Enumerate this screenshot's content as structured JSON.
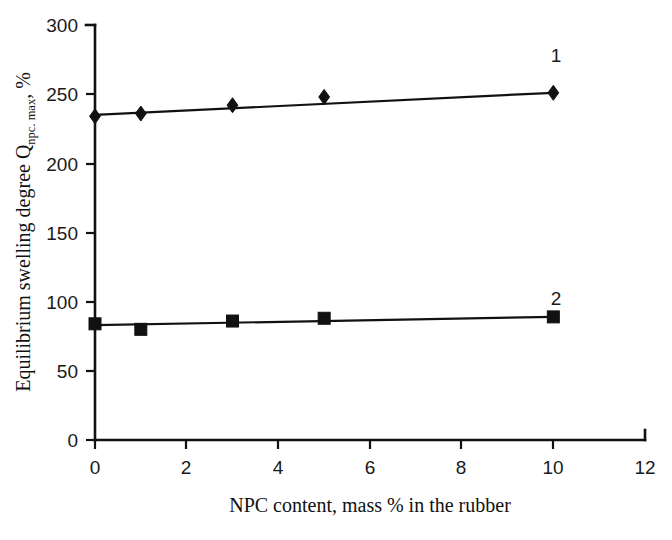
{
  "chart_data": {
    "type": "line",
    "title": "",
    "xlabel": "NPC content, mass % in the rubber",
    "ylabel_main": "Equilibrium swelling degree Q",
    "ylabel_subscript": "npc. max",
    "ylabel_tail": ", %",
    "xlim": [
      0,
      12
    ],
    "ylim": [
      0,
      300
    ],
    "xticks": [
      0,
      2,
      4,
      6,
      8,
      10,
      12
    ],
    "xtick_labels": [
      "0",
      "2",
      "4",
      "6",
      "8",
      "10",
      "12"
    ],
    "yticks": [
      0,
      50,
      100,
      150,
      200,
      250,
      300
    ],
    "ytick_labels": [
      "0",
      "50",
      "100",
      "150",
      "200",
      "250",
      "300"
    ],
    "grid": false,
    "legend_position": "inline-end-of-line",
    "series": [
      {
        "name": "1",
        "label": "1",
        "marker": "diamond",
        "color": "#111111",
        "x": [
          0,
          1,
          3,
          5,
          10
        ],
        "values": [
          234,
          236,
          242,
          248,
          251
        ],
        "fit_line": {
          "x": [
            0,
            10
          ],
          "y": [
            235,
            251
          ]
        }
      },
      {
        "name": "2",
        "label": "2",
        "marker": "square",
        "color": "#111111",
        "x": [
          0,
          1,
          3,
          5,
          10
        ],
        "values": [
          84,
          80,
          86,
          88,
          89
        ],
        "fit_line": {
          "x": [
            0,
            10
          ],
          "y": [
            83,
            89
          ]
        }
      }
    ],
    "annotations": [
      {
        "text": "1",
        "x": 10,
        "y": 276
      },
      {
        "text": "2",
        "x": 10,
        "y": 113
      }
    ]
  }
}
